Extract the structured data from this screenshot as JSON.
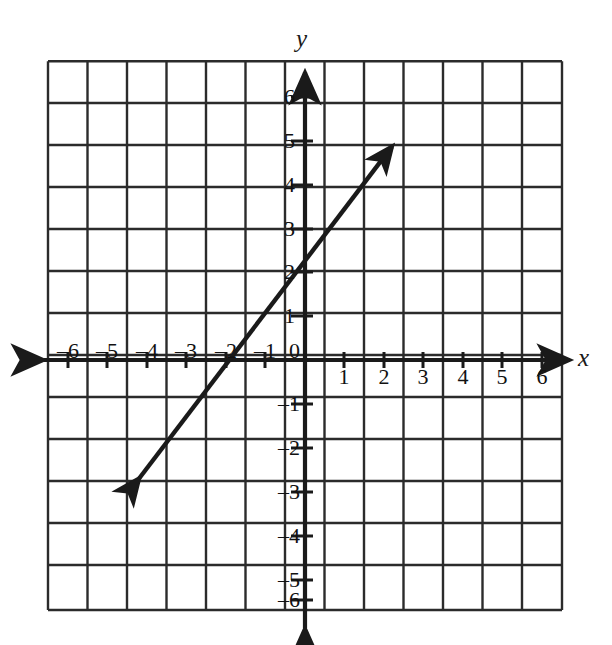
{
  "figure": {
    "kind": "coordinate-plane-line-graph",
    "background_color": "#ffffff",
    "ink_color": "#1a1a1a"
  },
  "axes": {
    "x_axis_label": "x",
    "y_axis_label": "y",
    "origin_label": "0",
    "x_ticks_negative": [
      "–6",
      "–5",
      "–4",
      "–3",
      "–2",
      "–1"
    ],
    "x_ticks_positive": [
      "1",
      "2",
      "3",
      "4",
      "5",
      "6"
    ],
    "y_ticks_positive": [
      "1",
      "2",
      "3",
      "4",
      "5",
      "6"
    ],
    "y_ticks_negative": [
      "–1",
      "–2",
      "–3",
      "–4",
      "–5",
      "–6"
    ],
    "x_min": -6,
    "x_max": 6,
    "y_min": -6,
    "y_max": 6,
    "grid": "on",
    "grid_step": 1,
    "arrowheads": "both-ends-both-axes"
  },
  "chart_data": {
    "type": "line",
    "title": "",
    "xlabel": "x",
    "ylabel": "y",
    "xlim": [
      -6,
      6
    ],
    "ylim": [
      -6,
      6
    ],
    "grid": true,
    "legend": "none",
    "series": [
      {
        "name": "line",
        "style": "solid-double-arrow",
        "color": "#1a1a1a",
        "slope": 1.6667,
        "y_intercept": 2,
        "x_intercept": -1.2,
        "equation": "y = 5/3 x + 2",
        "x": [
          -4.2,
          2.2
        ],
        "y": [
          -3.0,
          5.67
        ],
        "points_on_line": [
          {
            "x": -4.2,
            "y": -3.0
          },
          {
            "x": -3,
            "y": -3.0
          },
          {
            "x": -1.2,
            "y": 0
          },
          {
            "x": 0,
            "y": 2
          },
          {
            "x": 2.2,
            "y": 5.67
          }
        ],
        "arrow_start": {
          "x": -4.2,
          "y": -3.0
        },
        "arrow_end": {
          "x": 2.2,
          "y": 5.4
        }
      }
    ]
  }
}
